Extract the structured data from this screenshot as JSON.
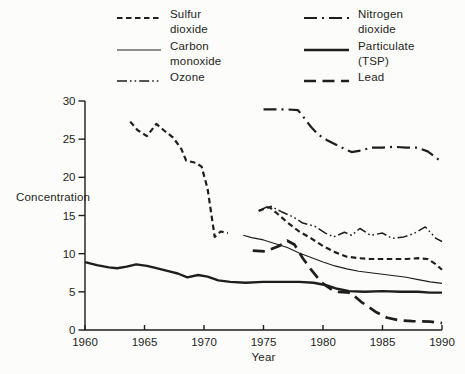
{
  "figure": {
    "background": "#fcfcfa",
    "ink_color": "#1e1e1c"
  },
  "legend": {
    "columns": [
      {
        "items": [
          {
            "series": "sulfur_dioxide",
            "label": "Sulfur\ndioxide"
          },
          {
            "series": "carbon_monoxide",
            "label": "Carbon\nmonoxide"
          },
          {
            "series": "ozone",
            "label": "Ozone"
          }
        ]
      },
      {
        "items": [
          {
            "series": "nitrogen_dioxide",
            "label": "Nitrogen\ndioxide"
          },
          {
            "series": "particulate_tsp",
            "label": "Particulate\n(TSP)"
          },
          {
            "series": "lead",
            "label": "Lead"
          }
        ]
      }
    ]
  },
  "chart_data": {
    "type": "line",
    "title": "",
    "xlabel": "Year",
    "ylabel": "Concentration",
    "xlim": [
      1960,
      1990
    ],
    "ylim": [
      0,
      30
    ],
    "x_ticks": [
      1960,
      1965,
      1970,
      1975,
      1980,
      1985,
      1990
    ],
    "y_ticks": [
      0,
      5,
      10,
      15,
      20,
      25,
      30
    ],
    "grid": false,
    "legend_position": "top",
    "series": [
      {
        "id": "sulfur_dioxide",
        "name": "Sulfur dioxide",
        "line_style": "dashed",
        "stroke_width": 2.2,
        "dash": "5.5 3.5",
        "segments": [
          [
            [
              1963.8,
              27.3
            ],
            [
              1964.4,
              26.2
            ],
            [
              1965.2,
              25.4
            ],
            [
              1966,
              27.0
            ],
            [
              1966.6,
              26.2
            ],
            [
              1967.4,
              25.2
            ],
            [
              1968.1,
              23.7
            ],
            [
              1968.5,
              22.2
            ],
            [
              1969.3,
              21.9
            ],
            [
              1969.8,
              21.4
            ],
            [
              1970.3,
              18.5
            ],
            [
              1970.9,
              12.2
            ],
            [
              1971.4,
              12.9
            ],
            [
              1972,
              12.7
            ]
          ],
          [
            [
              1974.6,
              15.6
            ],
            [
              1975.5,
              16.1
            ],
            [
              1976.2,
              15.2
            ],
            [
              1977,
              14.1
            ],
            [
              1978,
              12.9
            ],
            [
              1979,
              12.0
            ],
            [
              1980,
              11.0
            ],
            [
              1981,
              10.2
            ],
            [
              1982,
              9.6
            ],
            [
              1983,
              9.4
            ],
            [
              1984,
              9.3
            ],
            [
              1985,
              9.3
            ],
            [
              1986,
              9.3
            ],
            [
              1987,
              9.3
            ],
            [
              1988,
              9.4
            ],
            [
              1988.8,
              9.3
            ],
            [
              1989.5,
              8.6
            ],
            [
              1990,
              7.9
            ]
          ]
        ]
      },
      {
        "id": "carbon_monoxide",
        "name": "Carbon monoxide",
        "line_style": "solid-thin",
        "stroke_width": 1.1,
        "dash": "",
        "segments": [
          [
            [
              1973.3,
              12.4
            ],
            [
              1974,
              12.1
            ],
            [
              1975,
              11.8
            ],
            [
              1976,
              11.3
            ],
            [
              1977,
              10.8
            ],
            [
              1978,
              10.1
            ],
            [
              1979,
              9.5
            ],
            [
              1980,
              8.9
            ],
            [
              1981,
              8.4
            ],
            [
              1982,
              8.0
            ],
            [
              1983,
              7.7
            ],
            [
              1984,
              7.5
            ],
            [
              1985,
              7.3
            ],
            [
              1986,
              7.1
            ],
            [
              1987,
              6.9
            ],
            [
              1988,
              6.6
            ],
            [
              1989,
              6.3
            ],
            [
              1990,
              6.1
            ]
          ]
        ]
      },
      {
        "id": "ozone",
        "name": "Ozone",
        "line_style": "dash-dot-dot",
        "stroke_width": 1.5,
        "dash": "10 3 1.6 3 1.6 3",
        "segments": [
          [
            [
              1974.6,
              15.6
            ],
            [
              1975.5,
              16.3
            ],
            [
              1976.5,
              15.5
            ],
            [
              1977.5,
              14.8
            ],
            [
              1978.3,
              14.0
            ],
            [
              1979.3,
              13.6
            ],
            [
              1980.2,
              12.7
            ],
            [
              1980.9,
              12.2
            ],
            [
              1981.8,
              12.8
            ],
            [
              1982.4,
              12.4
            ],
            [
              1983.1,
              13.3
            ],
            [
              1984,
              12.4
            ],
            [
              1985,
              12.7
            ],
            [
              1985.8,
              12.0
            ],
            [
              1986.8,
              12.2
            ],
            [
              1987.6,
              12.6
            ],
            [
              1988.6,
              13.5
            ],
            [
              1989.5,
              12.0
            ],
            [
              1990,
              11.6
            ]
          ]
        ]
      },
      {
        "id": "nitrogen_dioxide",
        "name": "Nitrogen dioxide",
        "line_style": "dash-dot",
        "stroke_width": 2.2,
        "dash": "13 5 2 5",
        "segments": [
          [
            [
              1975,
              28.9
            ],
            [
              1976,
              28.9
            ],
            [
              1977,
              28.9
            ],
            [
              1977.9,
              28.8
            ],
            [
              1978.4,
              27.8
            ],
            [
              1979,
              26.6
            ],
            [
              1979.6,
              25.6
            ],
            [
              1980.3,
              24.9
            ],
            [
              1981.3,
              24.1
            ],
            [
              1982.4,
              23.3
            ],
            [
              1983.2,
              23.5
            ],
            [
              1984,
              23.9
            ],
            [
              1985,
              23.9
            ],
            [
              1986,
              24.0
            ],
            [
              1987,
              23.9
            ],
            [
              1987.9,
              23.9
            ],
            [
              1988.8,
              23.4
            ],
            [
              1990,
              22.0
            ]
          ]
        ]
      },
      {
        "id": "particulate_tsp",
        "name": "Particulate (TSP)",
        "line_style": "solid-thick",
        "stroke_width": 2.4,
        "dash": "",
        "segments": [
          [
            [
              1960,
              8.9
            ],
            [
              1961,
              8.5
            ],
            [
              1962,
              8.2
            ],
            [
              1962.7,
              8.1
            ],
            [
              1963.5,
              8.3
            ],
            [
              1964.3,
              8.6
            ],
            [
              1965.2,
              8.4
            ],
            [
              1966,
              8.1
            ],
            [
              1967,
              7.7
            ],
            [
              1967.8,
              7.4
            ],
            [
              1968.6,
              6.9
            ],
            [
              1969.5,
              7.2
            ],
            [
              1970.3,
              7.0
            ],
            [
              1971.2,
              6.5
            ],
            [
              1972.2,
              6.3
            ],
            [
              1973.5,
              6.2
            ],
            [
              1975,
              6.3
            ],
            [
              1976.5,
              6.3
            ],
            [
              1978,
              6.3
            ],
            [
              1979.2,
              6.2
            ],
            [
              1980.2,
              5.9
            ],
            [
              1981.2,
              5.4
            ],
            [
              1982.2,
              5.1
            ],
            [
              1983.5,
              5.0
            ],
            [
              1985,
              5.1
            ],
            [
              1986.5,
              5.0
            ],
            [
              1988,
              5.0
            ],
            [
              1989,
              4.9
            ],
            [
              1990,
              4.9
            ]
          ]
        ]
      },
      {
        "id": "lead",
        "name": "Lead",
        "line_style": "long-dash",
        "stroke_width": 2.7,
        "dash": "12 6.5",
        "segments": [
          [
            [
              1974.1,
              10.4
            ],
            [
              1975.2,
              10.3
            ],
            [
              1976.3,
              11.0
            ],
            [
              1977,
              11.7
            ],
            [
              1977.6,
              11.2
            ],
            [
              1978.3,
              9.4
            ],
            [
              1979,
              7.9
            ],
            [
              1979.9,
              6.2
            ],
            [
              1980.8,
              5.2
            ],
            [
              1981.3,
              5.0
            ],
            [
              1982.3,
              4.9
            ],
            [
              1983.2,
              3.7
            ],
            [
              1984.4,
              2.4
            ],
            [
              1985.4,
              1.6
            ],
            [
              1986.3,
              1.3
            ],
            [
              1987.5,
              1.15
            ],
            [
              1989,
              1.1
            ],
            [
              1990,
              0.9
            ]
          ]
        ]
      }
    ]
  }
}
